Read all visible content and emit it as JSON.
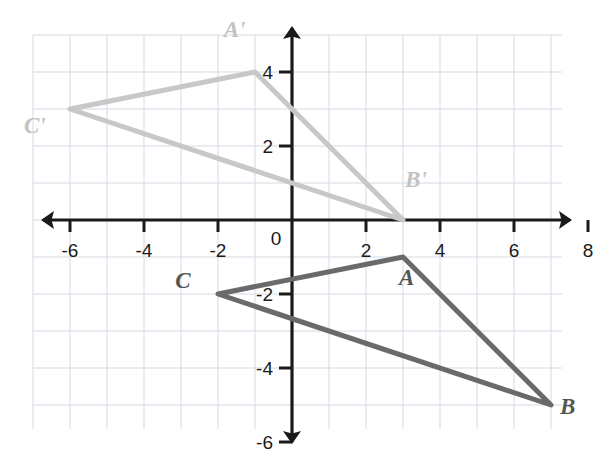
{
  "chart_data": {
    "type": "scatter",
    "title": "",
    "subtitle": "",
    "xlabel": "",
    "ylabel": "",
    "xlim": [
      -7.2,
      8.4
    ],
    "ylim": [
      -6.6,
      5.4
    ],
    "grid": true,
    "grid_step": 1,
    "legend": "none",
    "x_tick_labels": [
      "-6",
      "-4",
      "-2",
      "0",
      "2",
      "4",
      "6",
      "8"
    ],
    "x_tick_values": [
      -6,
      -4,
      -2,
      0,
      2,
      4,
      6,
      8
    ],
    "y_tick_labels": [
      "4",
      "2",
      "-2",
      "-4",
      "-6"
    ],
    "y_tick_values": [
      4,
      2,
      -2,
      -4,
      -6
    ],
    "origin_label": "0",
    "shapes": [
      {
        "name": "triangle-abc",
        "kind": "triangle",
        "color": "#6a6a6a",
        "stroke_width": 5,
        "vertices": [
          {
            "label": "A",
            "x": 3,
            "y": -1,
            "label_dx": 0.1,
            "label_dy": -0.75
          },
          {
            "label": "B",
            "x": 7,
            "y": -5,
            "label_dx": 0.45,
            "label_dy": -0.25
          },
          {
            "label": "C",
            "x": -2,
            "y": -2,
            "label_dx": -0.95,
            "label_dy": 0.15
          }
        ]
      },
      {
        "name": "triangle-a-prime-b-prime-c-prime",
        "kind": "triangle",
        "color": "#c8c8c8",
        "stroke_width": 5,
        "vertices": [
          {
            "label": "A'",
            "x": -1,
            "y": 4,
            "label_dx": -0.55,
            "label_dy": 0.95
          },
          {
            "label": "B'",
            "x": 3,
            "y": 0,
            "label_dx": 0.35,
            "label_dy": 0.9
          },
          {
            "label": "C'",
            "x": -6,
            "y": 3,
            "label_dx": -0.95,
            "label_dy": -0.65
          }
        ]
      }
    ],
    "colors": {
      "grid": "#d3dbe4",
      "axis": "#1a1a1a",
      "preimage": "#6a6a6a",
      "image": "#c8c8c8",
      "tick_text": "#1a1a1a",
      "background": "#ffffff"
    }
  }
}
